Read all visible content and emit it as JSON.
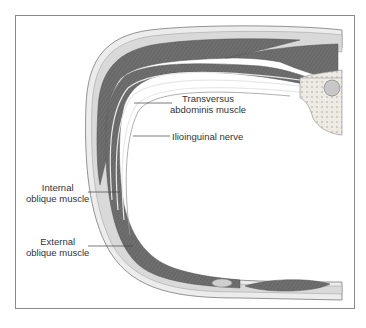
{
  "diagram": {
    "labels": {
      "transversus_line1": "Transversus",
      "transversus_line2": "abdominis muscle",
      "ilioinguinal": "Ilioinguinal nerve",
      "internal_line1": "Internal",
      "internal_line2": "oblique muscle",
      "external_line1": "External",
      "external_line2": "oblique muscle"
    },
    "colors": {
      "muscle": "#6f6f6f",
      "fascia": "#d9d9d9",
      "skin": "#ececec",
      "outline": "#7a7a7a",
      "bone": "#e6e2d8",
      "frame": "#8a8a8a"
    }
  }
}
